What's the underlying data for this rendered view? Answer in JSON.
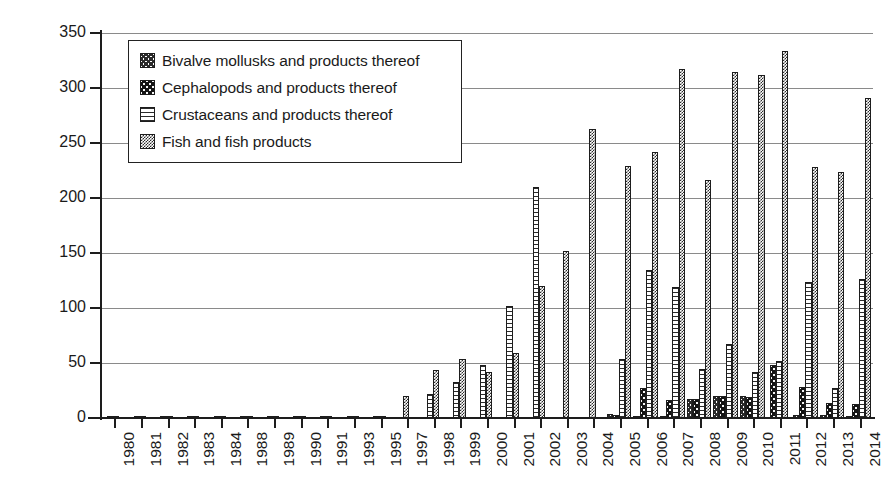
{
  "chart_data": {
    "type": "bar",
    "title": "",
    "xlabel": "",
    "ylabel": "Number of notifications",
    "ylim": [
      0,
      350
    ],
    "ytick_step": 50,
    "yticks": [
      0,
      50,
      100,
      150,
      200,
      250,
      300,
      350
    ],
    "grid": true,
    "legend_position": "top-left inside plot",
    "categories": [
      "1980",
      "1981",
      "1982",
      "1983",
      "1984",
      "1988",
      "1989",
      "1990",
      "1991",
      "1993",
      "1995",
      "1997",
      "1998",
      "1999",
      "2000",
      "2001",
      "2002",
      "2003",
      "2004",
      "2005",
      "2006",
      "2007",
      "2008",
      "2009",
      "2010",
      "2011",
      "2012",
      "2013",
      "2014"
    ],
    "series": [
      {
        "name": "Bivalve mollusks and products thereof",
        "pattern": "cross-hatch",
        "values": [
          0,
          0,
          0,
          0,
          0,
          0,
          0,
          0,
          0,
          0,
          0,
          0,
          0,
          0,
          0,
          0,
          0,
          0,
          0,
          4,
          2,
          2,
          17,
          20,
          20,
          0,
          3,
          3,
          2
        ]
      },
      {
        "name": "Cephalopods and products thereof",
        "pattern": "solid-black-dotted",
        "values": [
          1,
          1,
          1,
          1,
          1,
          1,
          1,
          2,
          1,
          1,
          0,
          0,
          0,
          0,
          0,
          0,
          0,
          0,
          0,
          3,
          27,
          16,
          17,
          20,
          19,
          48,
          28,
          14,
          13
        ]
      },
      {
        "name": "Crustaceans and products thereof",
        "pattern": "horizontal-lines",
        "values": [
          0,
          0,
          0,
          0,
          0,
          0,
          0,
          0,
          0,
          0,
          2,
          0,
          22,
          33,
          48,
          102,
          210,
          0,
          0,
          54,
          135,
          119,
          45,
          67,
          42,
          52,
          124,
          27,
          126
        ]
      },
      {
        "name": "Fish and fish products",
        "pattern": "dense-checker",
        "values": [
          1,
          1,
          2,
          1,
          2,
          1,
          1,
          2,
          1,
          2,
          1,
          20,
          44,
          54,
          42,
          59,
          120,
          152,
          263,
          229,
          242,
          317,
          216,
          315,
          312,
          334,
          228,
          224,
          291
        ]
      }
    ],
    "notes": {
      "bivalve_detail": {
        "2005": 4,
        "2006": 2,
        "2007": 2,
        "2008": 17,
        "2009": 20,
        "2010": 20,
        "2012": 3,
        "2013": 3,
        "2014": 2
      },
      "crustacean_extra": {
        "2005_secondary": 155,
        "2006_secondary": 153,
        "2007_secondary": 155,
        "2009_secondary": 122,
        "2010_secondary": 156,
        "2011_secondary": 65
      }
    }
  },
  "legend": {
    "items": [
      {
        "label": "Bivalve mollusks and products thereof",
        "pattern": "cross-hatch"
      },
      {
        "label": "Cephalopods and products thereof",
        "pattern": "solid-black-dotted"
      },
      {
        "label": "Crustaceans and products thereof",
        "pattern": "horizontal-lines"
      },
      {
        "label": "Fish and fish products",
        "pattern": "dense-checker"
      }
    ]
  },
  "axes": {
    "y_title": "Number of notifications"
  }
}
